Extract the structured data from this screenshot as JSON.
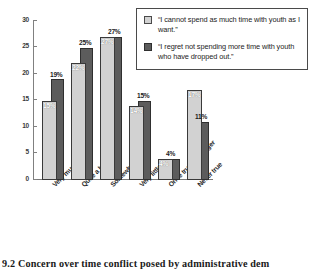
{
  "chart_data": {
    "type": "bar",
    "title": "",
    "xlabel": "",
    "ylabel": "",
    "ylim": [
      0,
      30
    ],
    "yticks": [
      0,
      5,
      10,
      15,
      20,
      25,
      30
    ],
    "grid": false,
    "legend_position": "top-right",
    "categories": [
      "Very much",
      "Quite a bit",
      "Somewhat",
      "Very little",
      "Once true, no longer",
      "Never true"
    ],
    "series": [
      {
        "name": "“I cannot spend as much time with youth as I want.”",
        "color": "#d2d2d2",
        "values": [
          15,
          22,
          27,
          14,
          4,
          17
        ],
        "labels": [
          "15%",
          "22%",
          "27%",
          "14%",
          "4%",
          "17%"
        ]
      },
      {
        "name": "“I regret not spending more time with youth who have dropped out.”",
        "color": "#5c5c5c",
        "values": [
          19,
          25,
          27,
          15,
          4,
          11
        ],
        "labels": [
          "19%",
          "25%",
          "27%",
          "15%",
          "4%",
          "11%"
        ]
      }
    ]
  },
  "axis": {
    "tick_labels": [
      "30",
      "25",
      "20",
      "15",
      "10",
      "5",
      "0"
    ]
  },
  "legend": {
    "items": [
      {
        "swatch": "light-gray-swatch",
        "text": "“I cannot spend as much time with youth as I want.”"
      },
      {
        "swatch": "dark-gray-swatch",
        "text": "“I regret not spending more time with youth who have dropped out.”"
      }
    ]
  },
  "caption": {
    "text": "9.2   Concern over time conflict posed by administrative dem"
  }
}
